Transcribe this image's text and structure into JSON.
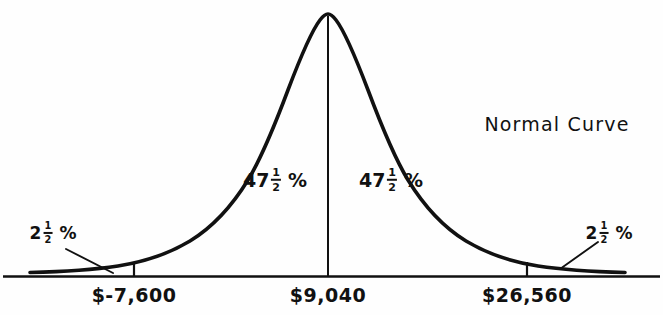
{
  "figure": {
    "title": "Normal Curve",
    "title_x": 557,
    "title_y": 115
  },
  "axis": {
    "baseline_y": 276,
    "ticks": [
      {
        "label": "$-7,600",
        "x": 134,
        "label_x": 134,
        "label_y": 286
      },
      {
        "label": "$9,040",
        "x": 328,
        "label_x": 328,
        "label_y": 286
      },
      {
        "label": "$26,560",
        "x": 527,
        "label_x": 527,
        "label_y": 286
      }
    ]
  },
  "regions": [
    {
      "name": "left-tail",
      "whole": "2",
      "numerator": "1",
      "denominator": "2",
      "symbol": "%",
      "x": 53,
      "y": 233
    },
    {
      "name": "left-center",
      "whole": "47",
      "numerator": "1",
      "denominator": "2",
      "symbol": "%",
      "x": 275,
      "y": 180
    },
    {
      "name": "right-center",
      "whole": "47",
      "numerator": "1",
      "denominator": "2",
      "symbol": "%",
      "x": 391,
      "y": 180
    },
    {
      "name": "right-tail",
      "whole": "2",
      "numerator": "1",
      "denominator": "2",
      "symbol": "%",
      "x": 609,
      "y": 233
    }
  ],
  "colors": {
    "ink": "#111111",
    "background": "#fefefe"
  },
  "chart_data": {
    "type": "line",
    "title": "Normal Curve",
    "xlabel": "",
    "ylabel": "",
    "curve": "gaussian",
    "mean_label": "$9,040",
    "mean_value": 9040,
    "lower_bound_label": "$-7,600",
    "lower_bound_value": -7600,
    "upper_bound_label": "$26,560",
    "upper_bound_value": 26560,
    "std_dev": 8780,
    "bound_sigma": 1.96,
    "area_labels": [
      "2 1/2 %",
      "47 1/2 %",
      "47 1/2 %",
      "2 1/2 %"
    ],
    "area_values": [
      2.5,
      47.5,
      47.5,
      2.5
    ],
    "grid": false,
    "legend": "none"
  }
}
